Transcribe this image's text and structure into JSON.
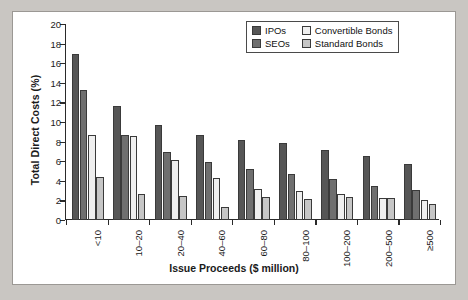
{
  "chart_data": {
    "type": "bar",
    "title": "",
    "xlabel": "Issue Proceeds ($ million)",
    "ylabel": "Total Direct Costs (%)",
    "ylim": [
      0,
      20
    ],
    "ytick_step": 2,
    "yticks": [
      "0",
      "2",
      "4",
      "6",
      "8",
      "10",
      "12",
      "14",
      "16",
      "18",
      "20"
    ],
    "grid": false,
    "legend_position": "top-right",
    "categories": [
      "<10",
      "10–20",
      "20–40",
      "40–60",
      "60–80",
      "80–100",
      "100–200",
      "200–500",
      "≥500"
    ],
    "series": [
      {
        "name": "IPOs",
        "color": "#565656",
        "values": [
          16.9,
          11.6,
          9.7,
          8.7,
          8.2,
          7.9,
          7.1,
          6.5,
          5.7
        ]
      },
      {
        "name": "SEOs",
        "color": "#6f6f6f",
        "values": [
          13.3,
          8.7,
          6.9,
          5.9,
          5.2,
          4.7,
          4.2,
          3.45,
          3.1
        ]
      },
      {
        "name": "Convertible Bonds",
        "color": "#efefef",
        "values": [
          8.7,
          8.6,
          6.1,
          4.3,
          3.2,
          3.0,
          2.7,
          2.2,
          2.05
        ]
      },
      {
        "name": "Standard Bonds",
        "color": "#c6c6c6",
        "values": [
          4.4,
          2.7,
          2.4,
          1.35,
          2.3,
          2.15,
          2.3,
          2.2,
          1.6
        ]
      }
    ]
  },
  "legend": {
    "entries": [
      {
        "label": "IPOs"
      },
      {
        "label": "Convertible Bonds"
      },
      {
        "label": "SEOs"
      },
      {
        "label": "Standard Bonds"
      }
    ]
  },
  "colors": {
    "background": "#c9c6c2",
    "panel": "#ffffff",
    "axis": "#2a2a2a",
    "text": "#1a1a1a"
  }
}
